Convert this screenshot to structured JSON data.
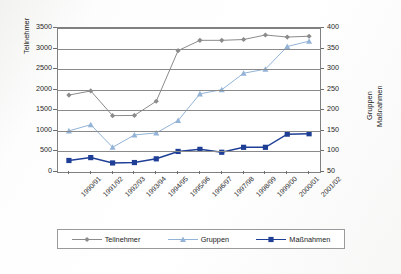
{
  "chart_data": {
    "type": "line",
    "title": "",
    "xlabel": "",
    "categories": [
      "1990/91",
      "1991/92",
      "1992/93",
      "1993/94",
      "1994/95",
      "1995/96",
      "1996/97",
      "1997/98",
      "1998/99",
      "1999/00",
      "2000/01",
      "2001/02"
    ],
    "axes": {
      "left": {
        "label": "Teilnehmer",
        "ticks": [
          "0",
          "500",
          "1000",
          "1500",
          "2000",
          "2500",
          "3000",
          "3500"
        ],
        "min": 0,
        "max": 3500,
        "step": 500
      },
      "right": {
        "label_line1": "Gruppen",
        "label_line2": "Maßnahmen",
        "ticks": [
          "50",
          "100",
          "150",
          "200",
          "250",
          "300",
          "350",
          "400"
        ],
        "min": 50,
        "max": 400,
        "step": 50
      }
    },
    "grid": true,
    "legend_position": "bottom",
    "series": [
      {
        "name": "Teilnehmer",
        "axis": "left",
        "color": "#8b8b8b",
        "marker": "diamond",
        "values": [
          1870,
          1970,
          1370,
          1375,
          1720,
          2950,
          3200,
          3200,
          3220,
          3330,
          3280,
          3300
        ]
      },
      {
        "name": "Gruppen",
        "axis": "right",
        "color": "#93b3d7",
        "marker": "triangle",
        "values": [
          150,
          165,
          110,
          140,
          145,
          175,
          240,
          250,
          290,
          300,
          355,
          368
        ]
      },
      {
        "name": "Maßnahmen",
        "axis": "right",
        "color": "#1f3f97",
        "marker": "square",
        "values": [
          78,
          85,
          72,
          73,
          82,
          100,
          105,
          98,
          110,
          110,
          142,
          143
        ]
      }
    ]
  },
  "legend": {
    "items": [
      {
        "label": "Teilnehmer"
      },
      {
        "label": "Gruppen"
      },
      {
        "label": "Maßnahmen"
      }
    ]
  }
}
